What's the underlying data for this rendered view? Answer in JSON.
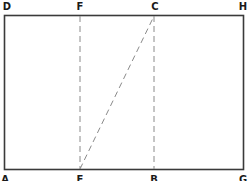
{
  "diagram": {
    "colors": {
      "frame": "#3a3a3a",
      "dashed": "#8a8a8a",
      "label": "#1a1a1a",
      "background": "#ffffff"
    },
    "frame": {
      "x1": 4.5,
      "y1": 15.5,
      "x2": 243.5,
      "y2": 169.5
    },
    "points": {
      "D": {
        "label": "D",
        "x": 4,
        "y": 15
      },
      "F": {
        "label": "F",
        "x": 80,
        "y": 15
      },
      "C": {
        "label": "C",
        "x": 154,
        "y": 15
      },
      "H": {
        "label": "H",
        "x": 243,
        "y": 15
      },
      "A": {
        "label": "A",
        "x": 4,
        "y": 170
      },
      "E": {
        "label": "E",
        "x": 80,
        "y": 170
      },
      "B": {
        "label": "B",
        "x": 154,
        "y": 170
      },
      "G": {
        "label": "G",
        "x": 243,
        "y": 170
      }
    },
    "dashed_lines": [
      {
        "name": "FE",
        "from": "F",
        "to": "E"
      },
      {
        "name": "CB",
        "from": "C",
        "to": "B"
      },
      {
        "name": "EC",
        "from": "E",
        "to": "C"
      }
    ]
  }
}
